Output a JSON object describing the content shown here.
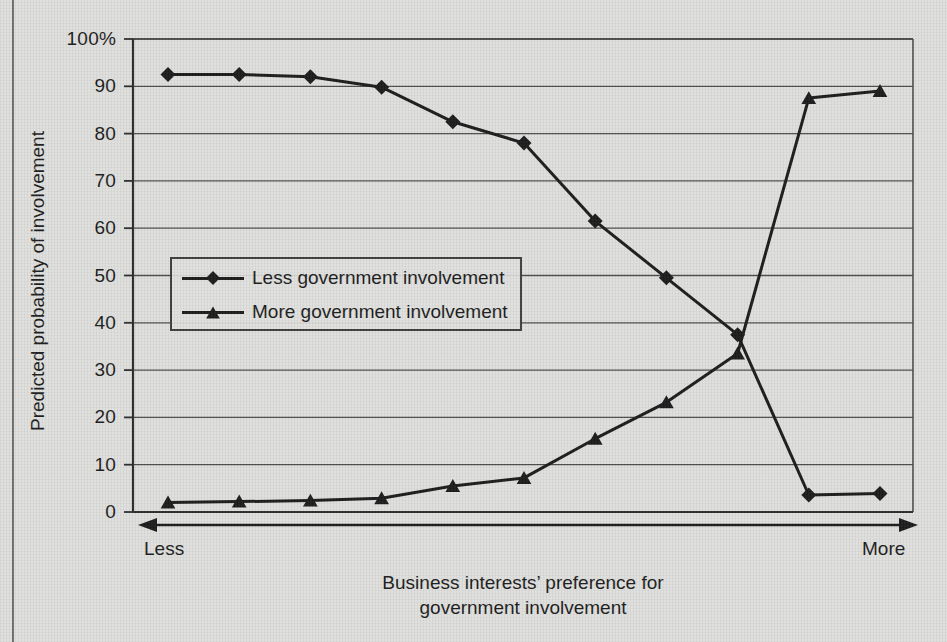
{
  "chart_data": {
    "type": "line",
    "title": "",
    "xlabel": "Business interests’ preference for government involvement",
    "ylabel": "Predicted probability of involvement",
    "ylim": [
      0,
      100
    ],
    "yticks": [
      0,
      10,
      20,
      30,
      40,
      50,
      60,
      70,
      80,
      90,
      100
    ],
    "ytick_labels": [
      "0",
      "10",
      "20",
      "30",
      "40",
      "50",
      "60",
      "70",
      "80",
      "90",
      "100%"
    ],
    "grid": true,
    "legend_position": "center-left",
    "x": [
      1,
      2,
      3,
      4,
      5,
      6,
      7,
      8,
      9,
      10,
      11
    ],
    "x_axis_annotation": {
      "left_label": "Less",
      "right_label": "More",
      "style": "double-headed-arrow"
    },
    "series": [
      {
        "name": "Less government involvement",
        "marker": "diamond",
        "values": [
          92.5,
          92.5,
          92.0,
          89.8,
          82.5,
          78.0,
          61.5,
          49.5,
          37.5,
          3.6,
          3.9
        ]
      },
      {
        "name": "More government involvement",
        "marker": "triangle",
        "values": [
          2.0,
          2.2,
          2.4,
          2.9,
          5.5,
          7.2,
          15.5,
          23.2,
          33.5,
          87.5,
          89.0
        ]
      }
    ]
  },
  "axis": {
    "y_title": "Predicted probability of involvement",
    "x_title_line1": "Business interests’ preference for",
    "x_title_line2": "government involvement",
    "x_left_end": "Less",
    "x_right_end": "More"
  },
  "legend": {
    "items": [
      {
        "label": "Less government involvement",
        "marker": "diamond"
      },
      {
        "label": "More government involvement",
        "marker": "triangle"
      }
    ]
  },
  "colors": {
    "background": "#dededc",
    "ink": "#1a1a1a",
    "gridline": "#4d4d4d",
    "axis": "#2b2b2b",
    "frame": "#6f6f6f"
  }
}
